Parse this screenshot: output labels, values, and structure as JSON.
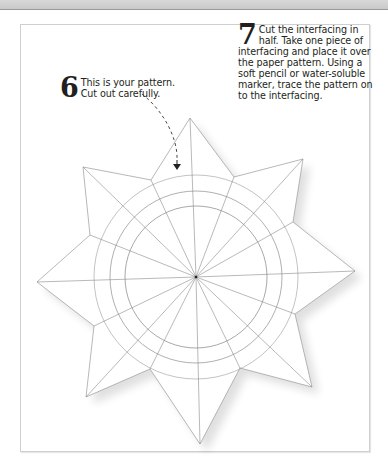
{
  "steps": [
    {
      "number": "6",
      "text": "This is your pattern. Cut out carefully."
    },
    {
      "number": "7",
      "text": "Cut the interfacing in half. Take one piece of interfacing and place it over the paper pattern. Using a soft pencil or water-soluble marker, trace the pattern on to the interfacing."
    }
  ],
  "illustration": {
    "subject": "eight-pointed-star-paper-pattern",
    "center": [
      196,
      277
    ],
    "circle_radii": [
      71,
      86,
      102
    ],
    "radial_lines": 16,
    "star_points": 8,
    "pointer": "dashed-arrow-down"
  },
  "colors": {
    "text": "#231f20",
    "pencil_line": "#8a8a8a",
    "frame": "#cfcfcf"
  }
}
